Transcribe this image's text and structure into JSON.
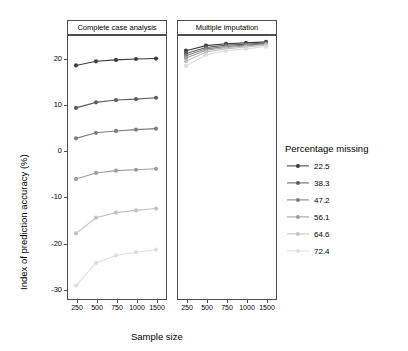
{
  "chart_data": {
    "type": "line",
    "title": "",
    "xlabel": "Sample size",
    "ylabel": "Index of prediction accuracy (%)",
    "ylim": [
      -32,
      25
    ],
    "yticks": [
      -30,
      -20,
      -10,
      0,
      10,
      20
    ],
    "ytick_labels": [
      "-30",
      "-20",
      "-10",
      "0",
      "10",
      "20"
    ],
    "x": [
      250,
      500,
      750,
      1000,
      1500
    ],
    "xtick_labels": [
      "250",
      "500",
      "750",
      "1000",
      "1500"
    ],
    "panels": [
      {
        "label": "Complete case analysis"
      },
      {
        "label": "Multiple imputation"
      }
    ],
    "legend": {
      "title": "Percentage missing",
      "position": "right",
      "entries": [
        {
          "label": "22.5",
          "color": "#3d3d3d"
        },
        {
          "label": "38.3",
          "color": "#5e5e5e"
        },
        {
          "label": "47.2",
          "color": "#7e7e7e"
        },
        {
          "label": "56.1",
          "color": "#9e9e9e"
        },
        {
          "label": "64.6",
          "color": "#c2c2c2"
        },
        {
          "label": "72.4",
          "color": "#dedede"
        }
      ]
    },
    "series": [
      {
        "name": "22.5",
        "color": "#3d3d3d",
        "panel_values": {
          "Complete case analysis": [
            18.4,
            19.3,
            19.6,
            19.8,
            19.9
          ],
          "Multiple imputation": [
            21.6,
            22.7,
            23.1,
            23.3,
            23.5
          ]
        }
      },
      {
        "name": "38.3",
        "color": "#5e5e5e",
        "panel_values": {
          "Complete case analysis": [
            9.2,
            10.4,
            10.9,
            11.1,
            11.4
          ],
          "Multiple imputation": [
            21.0,
            22.3,
            22.8,
            23.0,
            23.3
          ]
        }
      },
      {
        "name": "47.2",
        "color": "#7e7e7e",
        "panel_values": {
          "Complete case analysis": [
            2.6,
            3.8,
            4.2,
            4.5,
            4.7
          ],
          "Multiple imputation": [
            20.5,
            22.0,
            22.5,
            22.8,
            23.1
          ]
        }
      },
      {
        "name": "56.1",
        "color": "#9e9e9e",
        "panel_values": {
          "Complete case analysis": [
            -6.2,
            -4.9,
            -4.4,
            -4.2,
            -4.0
          ],
          "Multiple imputation": [
            20.0,
            21.7,
            22.3,
            22.6,
            23.0
          ]
        }
      },
      {
        "name": "64.6",
        "color": "#c2c2c2",
        "panel_values": {
          "Complete case analysis": [
            -18.0,
            -14.6,
            -13.5,
            -13.0,
            -12.6
          ],
          "Multiple imputation": [
            19.3,
            21.3,
            22.0,
            22.4,
            22.8
          ]
        }
      },
      {
        "name": "72.4",
        "color": "#dedede",
        "panel_values": {
          "Complete case analysis": [
            -29.3,
            -24.4,
            -22.8,
            -22.1,
            -21.5
          ],
          "Multiple imputation": [
            18.3,
            20.7,
            21.6,
            22.0,
            22.5
          ]
        }
      }
    ]
  }
}
